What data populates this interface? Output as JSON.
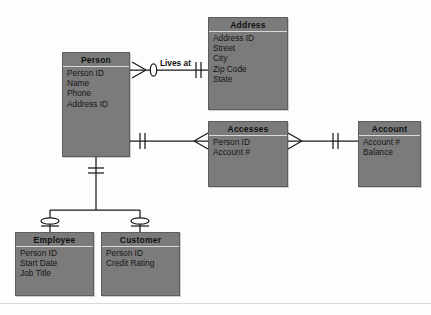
{
  "diagram": {
    "type": "entity-relationship-diagram",
    "notation": "crow's foot",
    "background_color": "#fdfdfd",
    "entity_fill_color": "#7b7b7b",
    "line_color": "#1a1a1a"
  },
  "entities": [
    {
      "id": "person",
      "title": "Person",
      "attributes": [
        "Person ID",
        "Name",
        "Phone",
        "Address ID"
      ]
    },
    {
      "id": "address",
      "title": "Address",
      "attributes": [
        "Address ID",
        "Street",
        "City",
        "Zip Code",
        "State"
      ]
    },
    {
      "id": "accesses",
      "title": "Accesses",
      "attributes": [
        "Person ID",
        "Account #"
      ]
    },
    {
      "id": "account",
      "title": "Account",
      "attributes": [
        "Account #",
        "Balance"
      ]
    },
    {
      "id": "employee",
      "title": "Employee",
      "attributes": [
        "Person ID",
        "Start Date",
        "Job Title"
      ]
    },
    {
      "id": "customer",
      "title": "Customer",
      "attributes": [
        "Person ID",
        "Credit Rating"
      ]
    }
  ],
  "relationships": [
    {
      "id": "lives-at",
      "label": "Lives at",
      "from": "person",
      "to": "address",
      "from_cardinality": "zero-or-many",
      "to_cardinality": "exactly-one"
    },
    {
      "id": "person-accesses",
      "label": "",
      "from": "person",
      "to": "accesses",
      "from_cardinality": "exactly-one",
      "to_cardinality": "many"
    },
    {
      "id": "accesses-account",
      "label": "",
      "from": "accesses",
      "to": "account",
      "from_cardinality": "many",
      "to_cardinality": "exactly-one"
    },
    {
      "id": "person-employee",
      "label": "",
      "from": "person",
      "to": "employee",
      "from_cardinality": "exactly-one",
      "to_cardinality": "zero-or-one"
    },
    {
      "id": "person-customer",
      "label": "",
      "from": "person",
      "to": "customer",
      "from_cardinality": "exactly-one",
      "to_cardinality": "zero-or-one"
    }
  ]
}
